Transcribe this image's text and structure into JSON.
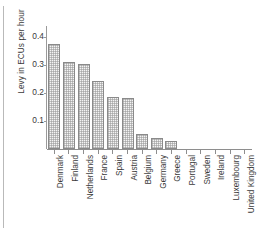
{
  "figure": {
    "y_axis_title": "Levy in ECUs per hour"
  },
  "chart_data": {
    "type": "bar",
    "title": "",
    "subtitle": "",
    "xlabel": "",
    "ylabel": "Levy in ECUs per hour",
    "ylim": [
      0,
      0.44
    ],
    "yticks": [
      0.1,
      0.2,
      0.3,
      0.4
    ],
    "ytick_labels": [
      "0.1",
      "0.2",
      "0.3",
      "0.4"
    ],
    "grid": false,
    "legend": null,
    "bar_style": {
      "fill": "#f4f4f4",
      "pattern": "cross-hatch-stipple",
      "edge": "#8a8a8a"
    },
    "categories": [
      "Denmark",
      "Finland",
      "Netherlands",
      "France",
      "Spain",
      "Austria",
      "Belgium",
      "Germany",
      "Greece",
      "Portugal",
      "Sweden",
      "Ireland",
      "Luxembourg",
      "United Kingdom"
    ],
    "values": [
      0.375,
      0.312,
      0.305,
      0.242,
      0.187,
      0.184,
      0.055,
      0.038,
      0.027,
      0.0,
      0.0,
      0.0,
      0.0,
      0.0
    ]
  }
}
